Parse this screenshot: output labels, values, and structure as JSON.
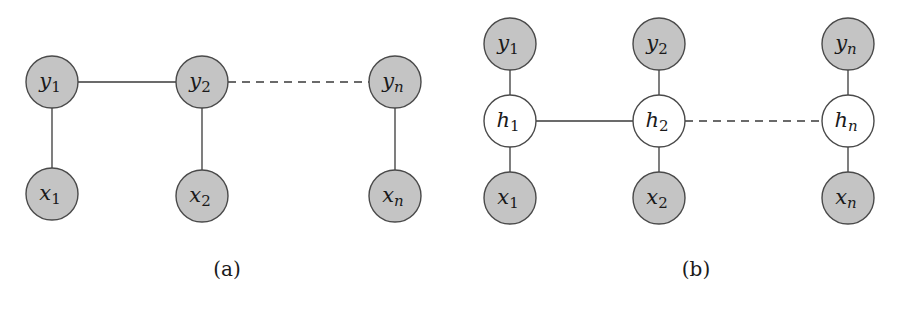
{
  "colors": {
    "observed_fill": "#c4c4c4",
    "hidden_fill": "#ffffff",
    "stroke": "#4a4a4a",
    "edge": "#3a3a3a"
  },
  "panels": [
    {
      "id": "a",
      "caption": "(a)",
      "nodes": [
        {
          "id": "y1",
          "base": "y",
          "sub": "1",
          "type": "observed"
        },
        {
          "id": "y2",
          "base": "y",
          "sub": "2",
          "type": "observed"
        },
        {
          "id": "yn",
          "base": "y",
          "sub": "n",
          "type": "observed"
        },
        {
          "id": "x1",
          "base": "x",
          "sub": "1",
          "type": "observed"
        },
        {
          "id": "x2",
          "base": "x",
          "sub": "2",
          "type": "observed"
        },
        {
          "id": "xn",
          "base": "x",
          "sub": "n",
          "type": "observed"
        }
      ],
      "edges": [
        {
          "from": "y1",
          "to": "y2",
          "style": "solid"
        },
        {
          "from": "y2",
          "to": "yn",
          "style": "dashed"
        },
        {
          "from": "y1",
          "to": "x1",
          "style": "solid"
        },
        {
          "from": "y2",
          "to": "x2",
          "style": "solid"
        },
        {
          "from": "yn",
          "to": "xn",
          "style": "solid"
        }
      ]
    },
    {
      "id": "b",
      "caption": "(b)",
      "nodes": [
        {
          "id": "y1",
          "base": "y",
          "sub": "1",
          "type": "observed"
        },
        {
          "id": "y2",
          "base": "y",
          "sub": "2",
          "type": "observed"
        },
        {
          "id": "yn",
          "base": "y",
          "sub": "n",
          "type": "observed"
        },
        {
          "id": "h1",
          "base": "h",
          "sub": "1",
          "type": "hidden"
        },
        {
          "id": "h2",
          "base": "h",
          "sub": "2",
          "type": "hidden"
        },
        {
          "id": "hn",
          "base": "h",
          "sub": "n",
          "type": "hidden"
        },
        {
          "id": "x1",
          "base": "x",
          "sub": "1",
          "type": "observed"
        },
        {
          "id": "x2",
          "base": "x",
          "sub": "2",
          "type": "observed"
        },
        {
          "id": "xn",
          "base": "x",
          "sub": "n",
          "type": "observed"
        }
      ],
      "edges": [
        {
          "from": "h1",
          "to": "h2",
          "style": "solid"
        },
        {
          "from": "h2",
          "to": "hn",
          "style": "dashed"
        },
        {
          "from": "y1",
          "to": "h1",
          "style": "solid"
        },
        {
          "from": "y2",
          "to": "h2",
          "style": "solid"
        },
        {
          "from": "yn",
          "to": "hn",
          "style": "solid"
        },
        {
          "from": "h1",
          "to": "x1",
          "style": "solid"
        },
        {
          "from": "h2",
          "to": "x2",
          "style": "solid"
        },
        {
          "from": "hn",
          "to": "xn",
          "style": "solid"
        }
      ]
    }
  ]
}
